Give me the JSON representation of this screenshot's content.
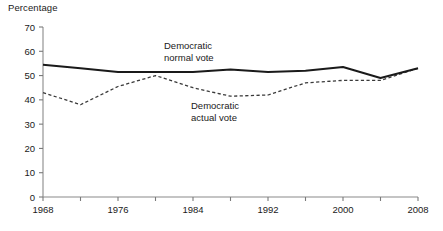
{
  "chart_data": {
    "type": "line",
    "title": "",
    "ylabel": "Percentage",
    "xlabel": "",
    "ylim": [
      0,
      70
    ],
    "ytick_step": 10,
    "yticks": [
      0,
      10,
      20,
      30,
      40,
      50,
      60,
      70
    ],
    "xlim": [
      1968,
      2008
    ],
    "xticks": [
      1968,
      1972,
      1976,
      1980,
      1984,
      1988,
      1992,
      1996,
      2000,
      2004,
      2008
    ],
    "xtick_labels": [
      "1968",
      "",
      "1976",
      "",
      "1984",
      "",
      "1992",
      "",
      "2000",
      "",
      "2008"
    ],
    "xtick_labels_shown": [
      "1968",
      "1976",
      "1984",
      "1992",
      "2000",
      "2008"
    ],
    "grid": false,
    "legend_position": "inline-annotation",
    "x": [
      1968,
      1972,
      1976,
      1980,
      1984,
      1988,
      1992,
      1996,
      2000,
      2004,
      2008
    ],
    "series": [
      {
        "name": "Democratic normal vote",
        "style": "solid",
        "color": "#1a1a1a",
        "values": [
          54.5,
          53.0,
          51.5,
          51.5,
          51.5,
          52.5,
          51.5,
          52.0,
          53.5,
          49.0,
          53.0
        ]
      },
      {
        "name": "Democratic actual vote",
        "style": "dashed",
        "color": "#3a3a3a",
        "values": [
          43.0,
          38.0,
          45.5,
          50.0,
          45.0,
          41.5,
          42.0,
          47.0,
          48.0,
          48.0,
          53.0
        ]
      }
    ],
    "annotations": [
      {
        "name": "normal-vote-label",
        "text_line1": "Democratic",
        "text_line2": "normal vote",
        "x": 1984,
        "y": 62
      },
      {
        "name": "actual-vote-label",
        "text_line1": "Democratic",
        "text_line2": "actual vote",
        "x": 1989,
        "y": 37
      }
    ]
  },
  "axis": {
    "y_title": "Percentage",
    "y_labels": [
      "70",
      "60",
      "50",
      "40",
      "30",
      "20",
      "10",
      "0"
    ],
    "x_labels": [
      "1968",
      "1976",
      "1984",
      "1992",
      "2000",
      "2008"
    ]
  },
  "labels": {
    "normal_line1": "Democratic",
    "normal_line2": "normal vote",
    "actual_line1": "Democratic",
    "actual_line2": "actual vote"
  },
  "colors": {
    "solid_line": "#1a1a1a",
    "dashed_line": "#3a3a3a",
    "axis": "#7a7a7a",
    "text": "#1a1a1a",
    "background": "#ffffff"
  }
}
